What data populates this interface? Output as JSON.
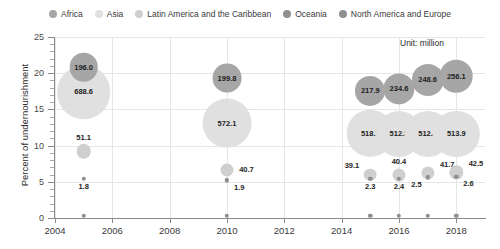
{
  "chart_data": {
    "type": "scatter",
    "title": "",
    "xlabel": "",
    "ylabel": "Percent of undernourishment",
    "xlim": [
      2004,
      2019
    ],
    "ylim": [
      0,
      25
    ],
    "grid": true,
    "legend_position": "top",
    "annotation": "Unit: million",
    "bubble_value_unit": "million",
    "bubble_value_meaning": "Number of undernourished people (million)",
    "y_ticks": [
      0,
      5,
      10,
      15,
      20,
      25
    ],
    "x_ticks": [
      2004,
      2006,
      2008,
      2010,
      2012,
      2014,
      2016,
      2018
    ],
    "legend": [
      {
        "name": "Africa",
        "color": "#a6a6a6"
      },
      {
        "name": "Asia",
        "color": "#e0e0e0"
      },
      {
        "name": "Latin America and the Caribbean",
        "color": "#cfcfcf"
      },
      {
        "name": "Oceania",
        "color": "#8f8f8f"
      },
      {
        "name": "North America and Europe",
        "color": "#8f8f8f"
      }
    ],
    "series": [
      {
        "name": "Africa",
        "color": "#a6a6a6",
        "points": [
          {
            "x": 2005,
            "y": 20.8,
            "size": 196.0,
            "label": "196.0",
            "label_pos": "inside"
          },
          {
            "x": 2010,
            "y": 19.3,
            "size": 199.8,
            "label": "199.8",
            "label_pos": "inside"
          },
          {
            "x": 2015,
            "y": 17.6,
            "size": 217.9,
            "label": "217.9",
            "label_pos": "inside"
          },
          {
            "x": 2016,
            "y": 17.8,
            "size": 234.6,
            "label": "234.6",
            "label_pos": "inside"
          },
          {
            "x": 2017,
            "y": 19.1,
            "size": 248.6,
            "label": "248.6",
            "label_pos": "inside"
          },
          {
            "x": 2018,
            "y": 19.6,
            "size": 256.1,
            "label": "256.1",
            "label_pos": "inside"
          }
        ]
      },
      {
        "name": "Asia",
        "color": "#e0e0e0",
        "points": [
          {
            "x": 2005,
            "y": 17.4,
            "size": 688.6,
            "label": "688.6",
            "label_pos": "inside"
          },
          {
            "x": 2010,
            "y": 13.1,
            "size": 572.1,
            "label": "572.1",
            "label_pos": "inside"
          },
          {
            "x": 2015,
            "y": 11.7,
            "size": 518.7,
            "label": "518.7",
            "label_pos": "inside"
          },
          {
            "x": 2016,
            "y": 11.6,
            "size": 512.3,
            "label": "512.3",
            "label_pos": "inside"
          },
          {
            "x": 2017,
            "y": 11.6,
            "size": 512.4,
            "label": "512.4",
            "label_pos": "inside"
          },
          {
            "x": 2018,
            "y": 11.6,
            "size": 513.9,
            "label": "513.9",
            "label_pos": "inside"
          }
        ]
      },
      {
        "name": "Latin America and the Caribbean",
        "color": "#cfcfcf",
        "points": [
          {
            "x": 2005,
            "y": 9.2,
            "size": 51.1,
            "label": "51.1",
            "label_pos": "above"
          },
          {
            "x": 2010,
            "y": 6.6,
            "size": 40.7,
            "label": "40.7",
            "label_pos": "right"
          },
          {
            "x": 2015,
            "y": 6.0,
            "size": 39.1,
            "label": "39.1",
            "label_pos": "upper-left"
          },
          {
            "x": 2016,
            "y": 6.0,
            "size": 40.4,
            "label": "40.4",
            "label_pos": "above"
          },
          {
            "x": 2017,
            "y": 6.2,
            "size": 41.7,
            "label": "41.7",
            "label_pos": "upper-right"
          },
          {
            "x": 2018,
            "y": 6.3,
            "size": 42.5,
            "label": "42.5",
            "label_pos": "upper-right"
          }
        ]
      },
      {
        "name": "Oceania",
        "color": "#8f8f8f",
        "points": [
          {
            "x": 2005,
            "y": 5.4,
            "size": 1.8,
            "label": "1.8",
            "label_pos": "below"
          },
          {
            "x": 2010,
            "y": 5.2,
            "size": 1.9,
            "label": "1.9",
            "label_pos": "below-right"
          },
          {
            "x": 2015,
            "y": 5.4,
            "size": 2.3,
            "label": "2.3",
            "label_pos": "below"
          },
          {
            "x": 2016,
            "y": 5.4,
            "size": 2.4,
            "label": "2.4",
            "label_pos": "below"
          },
          {
            "x": 2017,
            "y": 5.6,
            "size": 2.5,
            "label": "2.5",
            "label_pos": "below-left"
          },
          {
            "x": 2018,
            "y": 5.7,
            "size": 2.6,
            "label": "2.6",
            "label_pos": "below-right"
          }
        ]
      },
      {
        "name": "North America and Europe",
        "color": "#8f8f8f",
        "points": [
          {
            "x": 2005,
            "y": 0.3,
            "size": 0.6,
            "label": "",
            "label_pos": "none"
          },
          {
            "x": 2010,
            "y": 0.3,
            "size": 0.6,
            "label": "",
            "label_pos": "none"
          },
          {
            "x": 2015,
            "y": 0.3,
            "size": 0.6,
            "label": "",
            "label_pos": "none"
          },
          {
            "x": 2016,
            "y": 0.3,
            "size": 0.6,
            "label": "",
            "label_pos": "none"
          },
          {
            "x": 2017,
            "y": 0.3,
            "size": 0.6,
            "label": "",
            "label_pos": "none"
          },
          {
            "x": 2018,
            "y": 0.3,
            "size": 0.6,
            "label": "",
            "label_pos": "none"
          }
        ]
      }
    ]
  }
}
